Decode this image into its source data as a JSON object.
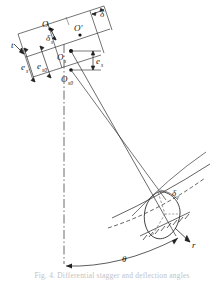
{
  "figure": {
    "background_color": "#ffffff",
    "line_color": "#333333",
    "label_color": "#1a1a1a",
    "width": 224,
    "height": 282
  },
  "labels": {
    "o": "O",
    "o_prime": "O′",
    "delta": "δ",
    "delta_s": "δ",
    "delta_s_sub": "s",
    "t": "t",
    "e_s_prime": "e",
    "e_s_prime_sub": "s′",
    "e_s0": "e",
    "e_s0_sub": "s0",
    "o_s": "O",
    "o_s_sub": "s",
    "o_s0": "O",
    "o_s0_sub": "s0",
    "e_s": "e",
    "e_s_sub": "s",
    "delta_e": "δ",
    "delta_e_sub": "ε",
    "r": "r",
    "theta": "θ"
  },
  "caption": {
    "text": "Fig. 4.  Differential stagger and deflection angles"
  },
  "elements": {
    "centerline_name": "vertical-dash-dot-axis",
    "arc_name": "circumferential-arc",
    "hatching_name": "fixed-support-hatching",
    "ellipse_name": "blade-section-outline"
  }
}
